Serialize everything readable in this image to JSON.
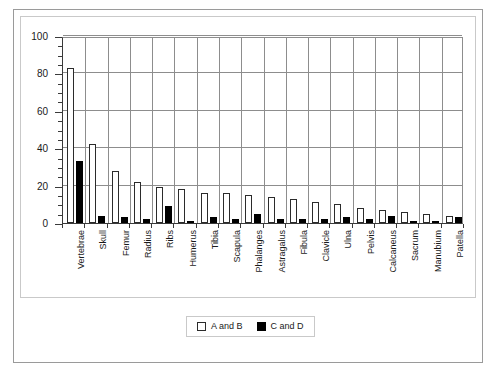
{
  "chart_data": {
    "type": "bar",
    "title": "",
    "xlabel": "",
    "ylabel": "",
    "ylim": [
      0,
      100
    ],
    "ytick_values": [
      0,
      20,
      40,
      60,
      80,
      100
    ],
    "ytick_labels": [
      "0",
      "20",
      "40",
      "60",
      "80",
      "100"
    ],
    "minor_tick_step": 5,
    "grid": true,
    "grid_axes": "both",
    "legend_position": "bottom-center",
    "categories": [
      "Vertebrae",
      "Skull",
      "Femur",
      "Radius",
      "Ribs",
      "Humerus",
      "Tibia",
      "Scapula",
      "Phalanges",
      "Astragalus",
      "Fibula",
      "Clavicle",
      "Ulna",
      "Pelvis",
      "Calcaneus",
      "Sacrum",
      "Manubium",
      "Patella"
    ],
    "series": [
      {
        "name": "A and B",
        "fill": "#ffffff",
        "edge": "#2b2b2b",
        "values": [
          83,
          42,
          28,
          22,
          19,
          18,
          16,
          16,
          15,
          14,
          13,
          11,
          10,
          8,
          7,
          6,
          5,
          4
        ]
      },
      {
        "name": "C and D",
        "fill": "#000000",
        "edge": "#000000",
        "values": [
          33,
          4,
          3,
          2,
          9,
          1,
          3,
          2,
          5,
          2,
          2,
          2,
          3,
          2,
          4,
          1,
          1,
          3
        ]
      }
    ]
  },
  "legend": {
    "entries": [
      {
        "label": "A and B",
        "swatch": "open-square-swatch"
      },
      {
        "label": "C and D",
        "swatch": "filled-square-swatch"
      }
    ]
  },
  "caption": {
    "text": ""
  }
}
